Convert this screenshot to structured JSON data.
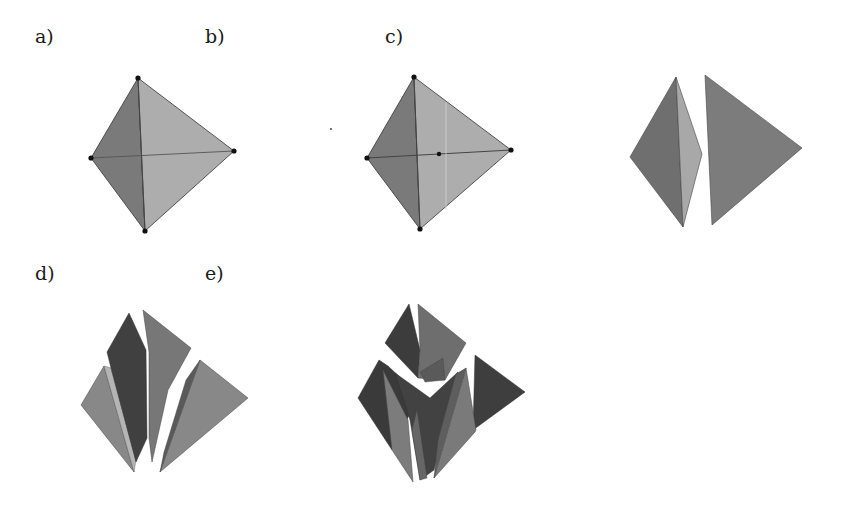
{
  "figure": {
    "panels": [
      {
        "id": "a",
        "label": "a)",
        "caption": "tetrahedron with vertices marked"
      },
      {
        "id": "b",
        "label": "b)",
        "caption": "tetrahedron with edge midpoint marked"
      },
      {
        "id": "c",
        "label": "c)",
        "caption": "tetrahedron split into two pieces"
      },
      {
        "id": "d",
        "label": "d)",
        "caption": "tetrahedron split into four pieces"
      },
      {
        "id": "e",
        "label": "e)",
        "caption": "tetrahedron split into many pieces"
      }
    ],
    "colors": {
      "dark_face": "#6f6f6f",
      "light_face": "#a9a9a9",
      "medium_face": "#8a8a8a",
      "darkest_face": "#3f3f3f",
      "edge": "#333333",
      "vertex": "#111111"
    }
  }
}
